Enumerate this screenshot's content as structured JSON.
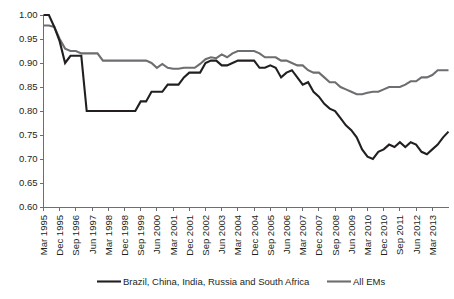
{
  "chart_data": {
    "type": "line",
    "title": "",
    "subtitle": "",
    "xlabel": "",
    "ylabel": "",
    "ylim": [
      0.6,
      1.0
    ],
    "yticks": [
      "1.00",
      "0.95",
      "0.90",
      "0.85",
      "0.80",
      "0.75",
      "0.70",
      "0.65",
      "0.60"
    ],
    "ytick_values": [
      1.0,
      0.95,
      0.9,
      0.85,
      0.8,
      0.75,
      0.7,
      0.65,
      0.6
    ],
    "grid": false,
    "legend_position": "bottom",
    "x_tick_labels": [
      "Mar 1995",
      "Dec 1995",
      "Sep 1996",
      "Jun 1997",
      "Mar 1998",
      "Dec 1998",
      "Sep 1999",
      "Jun 2000",
      "Mar 2001",
      "Dec 2001",
      "Sep 2002",
      "Jun 2003",
      "Mar 2004",
      "Dec 2004",
      "Sep 2005",
      "Jun 2006",
      "Mar 2007",
      "Dec 2007",
      "Sep 2008",
      "Jun 2009",
      "Mar 2010",
      "Dec 2010",
      "Sep 2011",
      "Jun 2012",
      "Mar 2013"
    ],
    "x_tick_step_quarters": 3,
    "x": [
      "Mar 1995",
      "Jun 1995",
      "Sep 1995",
      "Dec 1995",
      "Mar 1996",
      "Jun 1996",
      "Sep 1996",
      "Dec 1996",
      "Mar 1997",
      "Jun 1997",
      "Sep 1997",
      "Dec 1997",
      "Mar 1998",
      "Jun 1998",
      "Sep 1998",
      "Dec 1998",
      "Mar 1999",
      "Jun 1999",
      "Sep 1999",
      "Dec 1999",
      "Mar 2000",
      "Jun 2000",
      "Sep 2000",
      "Dec 2000",
      "Mar 2001",
      "Jun 2001",
      "Sep 2001",
      "Dec 2001",
      "Mar 2002",
      "Jun 2002",
      "Sep 2002",
      "Dec 2002",
      "Mar 2003",
      "Jun 2003",
      "Sep 2003",
      "Dec 2003",
      "Mar 2004",
      "Jun 2004",
      "Sep 2004",
      "Dec 2004",
      "Mar 2005",
      "Jun 2005",
      "Sep 2005",
      "Dec 2005",
      "Mar 2006",
      "Jun 2006",
      "Sep 2006",
      "Dec 2006",
      "Mar 2007",
      "Jun 2007",
      "Sep 2007",
      "Dec 2007",
      "Mar 2008",
      "Jun 2008",
      "Sep 2008",
      "Dec 2008",
      "Mar 2009",
      "Jun 2009",
      "Sep 2009",
      "Dec 2009",
      "Mar 2010",
      "Jun 2010",
      "Sep 2010",
      "Dec 2010",
      "Mar 2011",
      "Jun 2011",
      "Sep 2011",
      "Dec 2011",
      "Mar 2012",
      "Jun 2012",
      "Sep 2012",
      "Dec 2012",
      "Mar 2013",
      "Jun 2013",
      "Sep 2013",
      "Dec 2013"
    ],
    "series": [
      {
        "name": "Brazil, China, India, Russia and South Africa",
        "color": "#231f20",
        "width": 2.1,
        "values": [
          1.0,
          1.0,
          0.975,
          0.945,
          0.9,
          0.915,
          0.915,
          0.915,
          0.8,
          0.8,
          0.8,
          0.8,
          0.8,
          0.8,
          0.8,
          0.8,
          0.8,
          0.8,
          0.82,
          0.82,
          0.84,
          0.84,
          0.84,
          0.855,
          0.855,
          0.855,
          0.87,
          0.88,
          0.88,
          0.88,
          0.9,
          0.905,
          0.905,
          0.895,
          0.895,
          0.9,
          0.905,
          0.905,
          0.905,
          0.905,
          0.89,
          0.89,
          0.895,
          0.89,
          0.87,
          0.88,
          0.885,
          0.87,
          0.855,
          0.86,
          0.84,
          0.83,
          0.815,
          0.805,
          0.8,
          0.785,
          0.77,
          0.76,
          0.745,
          0.72,
          0.705,
          0.7,
          0.715,
          0.72,
          0.73,
          0.725,
          0.735,
          0.725,
          0.735,
          0.73,
          0.715,
          0.71,
          0.72,
          0.73,
          0.745,
          0.757
        ]
      },
      {
        "name": "All EMs",
        "color": "#6d6e71",
        "width": 2.1,
        "values": [
          0.978,
          0.978,
          0.975,
          0.95,
          0.93,
          0.925,
          0.925,
          0.92,
          0.92,
          0.92,
          0.92,
          0.905,
          0.905,
          0.905,
          0.905,
          0.905,
          0.905,
          0.905,
          0.905,
          0.905,
          0.9,
          0.89,
          0.898,
          0.89,
          0.888,
          0.888,
          0.89,
          0.89,
          0.89,
          0.898,
          0.908,
          0.912,
          0.91,
          0.918,
          0.912,
          0.92,
          0.925,
          0.925,
          0.925,
          0.925,
          0.92,
          0.912,
          0.912,
          0.912,
          0.905,
          0.905,
          0.9,
          0.895,
          0.895,
          0.885,
          0.88,
          0.88,
          0.87,
          0.86,
          0.86,
          0.85,
          0.845,
          0.84,
          0.835,
          0.835,
          0.838,
          0.84,
          0.84,
          0.845,
          0.85,
          0.85,
          0.85,
          0.855,
          0.862,
          0.862,
          0.87,
          0.87,
          0.875,
          0.885,
          0.885,
          0.885
        ]
      }
    ]
  },
  "legend": {
    "items": [
      {
        "label": "Brazil, China, India, Russia and South Africa",
        "color": "#231f20"
      },
      {
        "label": "All EMs",
        "color": "#6d6e71"
      }
    ]
  },
  "colors": {
    "axis": "#6d6e71",
    "text": "#231f20",
    "background": "#ffffff",
    "series_brics": "#231f20",
    "series_allems": "#6d6e71"
  }
}
